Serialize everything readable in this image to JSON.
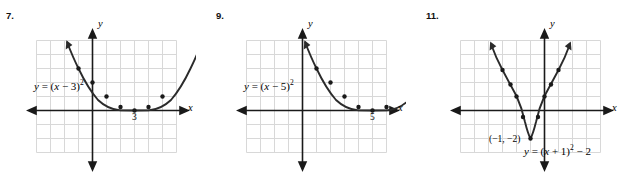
{
  "page": {
    "background": "#ffffff",
    "grid_color": "#d8d8d8",
    "axis_color": "#1a1a1a",
    "curve_color": "#2b2b2b"
  },
  "problems": [
    {
      "number": "7.",
      "equation_html": "<i>y</i> = (<i>x</i> &minus; 3)<sup>2</sup>",
      "equation_text": "y = (x - 3)^2",
      "y_axis_label": "y",
      "x_axis_label": "x",
      "vertex_label": "3",
      "chart_data": {
        "type": "line",
        "title": "",
        "xlabel": "x",
        "ylabel": "y",
        "xlim": [
          -5,
          5
        ],
        "ylim": [
          -4,
          6
        ],
        "grid": true,
        "vertex": [
          3,
          0
        ],
        "equation": "y = (x - 3)^2",
        "points": [
          {
            "x": 0.8,
            "y": 4.84
          },
          {
            "x": 1.2,
            "y": 3.24
          },
          {
            "x": 1.6,
            "y": 1.96
          },
          {
            "x": 2.0,
            "y": 1.0
          },
          {
            "x": 2.4,
            "y": 0.36
          },
          {
            "x": 3.0,
            "y": 0.0
          },
          {
            "x": 3.6,
            "y": 0.36
          },
          {
            "x": 4.0,
            "y": 1.0
          },
          {
            "x": 4.4,
            "y": 1.96
          },
          {
            "x": 4.8,
            "y": 3.24
          },
          {
            "x": 5.2,
            "y": 4.84
          }
        ],
        "marked_points": [
          {
            "x": 1.4,
            "y": 2.56
          },
          {
            "x": 2.0,
            "y": 1.0
          },
          {
            "x": 2.5,
            "y": 0.25
          },
          {
            "x": 3.0,
            "y": 0.0
          },
          {
            "x": 3.5,
            "y": 0.25
          },
          {
            "x": 4.0,
            "y": 1.0
          },
          {
            "x": 4.6,
            "y": 2.56
          }
        ]
      }
    },
    {
      "number": "9.",
      "equation_html": "<i>y</i> = (<i>x</i> &minus; 5)<sup>2</sup>",
      "equation_text": "y = (x - 5)^2",
      "y_axis_label": "y",
      "x_axis_label": "x",
      "vertex_label": "5",
      "chart_data": {
        "type": "line",
        "title": "",
        "xlabel": "x",
        "ylabel": "y",
        "xlim": [
          -5,
          7
        ],
        "ylim": [
          -4,
          6
        ],
        "grid": true,
        "vertex": [
          5,
          0
        ],
        "equation": "y = (x - 5)^2",
        "points": [
          {
            "x": 2.8,
            "y": 4.84
          },
          {
            "x": 3.2,
            "y": 3.24
          },
          {
            "x": 3.6,
            "y": 1.96
          },
          {
            "x": 4.0,
            "y": 1.0
          },
          {
            "x": 4.4,
            "y": 0.36
          },
          {
            "x": 5.0,
            "y": 0.0
          },
          {
            "x": 5.6,
            "y": 0.36
          },
          {
            "x": 6.0,
            "y": 1.0
          },
          {
            "x": 6.4,
            "y": 1.96
          },
          {
            "x": 6.8,
            "y": 3.24
          },
          {
            "x": 7.2,
            "y": 4.84
          }
        ],
        "marked_points": [
          {
            "x": 3.4,
            "y": 2.56
          },
          {
            "x": 4.0,
            "y": 1.0
          },
          {
            "x": 4.5,
            "y": 0.25
          },
          {
            "x": 5.0,
            "y": 0.0
          },
          {
            "x": 5.5,
            "y": 0.25
          },
          {
            "x": 6.0,
            "y": 1.0
          },
          {
            "x": 6.6,
            "y": 2.56
          }
        ]
      }
    },
    {
      "number": "11.",
      "equation_html": "<i>y</i> = (<i>x</i> + 1)<sup>2</sup> &minus; 2",
      "equation_text": "y = (x + 1)^2 - 2",
      "y_axis_label": "y",
      "x_axis_label": "x",
      "vertex_label": "(&minus;1, &minus;2)",
      "vertex_text": "(-1, -2)",
      "chart_data": {
        "type": "line",
        "title": "",
        "xlabel": "x",
        "ylabel": "y",
        "xlim": [
          -5,
          5
        ],
        "ylim": [
          -4,
          6
        ],
        "grid": true,
        "vertex": [
          -1,
          -2
        ],
        "equation": "y = (x + 1)^2 - 2",
        "points": [
          {
            "x": -3.8,
            "y": 5.84
          },
          {
            "x": -3.4,
            "y": 3.76
          },
          {
            "x": -3.0,
            "y": 2.0
          },
          {
            "x": -2.5,
            "y": 0.25
          },
          {
            "x": -2.0,
            "y": -1.0
          },
          {
            "x": -1.5,
            "y": -1.75
          },
          {
            "x": -1.0,
            "y": -2.0
          },
          {
            "x": -0.5,
            "y": -1.75
          },
          {
            "x": 0.0,
            "y": -1.0
          },
          {
            "x": 0.5,
            "y": 0.25
          },
          {
            "x": 1.0,
            "y": 2.0
          },
          {
            "x": 1.4,
            "y": 3.76
          },
          {
            "x": 1.8,
            "y": 5.84
          }
        ],
        "marked_points": [
          {
            "x": -3.2,
            "y": 2.84
          },
          {
            "x": -2.6,
            "y": 0.56
          },
          {
            "x": -2.0,
            "y": -1.0
          },
          {
            "x": -1.5,
            "y": -1.75
          },
          {
            "x": -1.0,
            "y": -2.0
          },
          {
            "x": -0.5,
            "y": -1.75
          },
          {
            "x": 0.0,
            "y": -1.0
          },
          {
            "x": 0.6,
            "y": 0.56
          },
          {
            "x": 1.2,
            "y": 2.84
          }
        ]
      }
    }
  ]
}
